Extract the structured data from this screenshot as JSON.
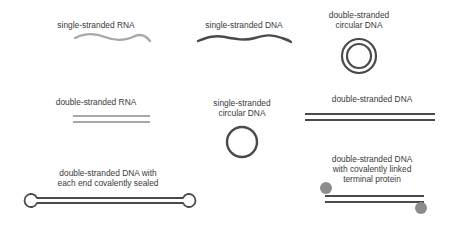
{
  "diagram": {
    "items": [
      {
        "id": "ss-rna",
        "label": "single-stranded RNA",
        "color": "#a8a8a8"
      },
      {
        "id": "ss-dna",
        "label": "single-stranded DNA",
        "color": "#4a4a4a"
      },
      {
        "id": "ds-circ-dna",
        "label": "double-stranded circular DNA",
        "label_lines": [
          "double-stranded",
          "circular DNA"
        ],
        "color": "#4a4a4a"
      },
      {
        "id": "ds-rna",
        "label": "double-stranded RNA",
        "color": "#a8a8a8"
      },
      {
        "id": "ss-circ-dna",
        "label": "single-stranded circular DNA",
        "label_lines": [
          "single-stranded",
          "circular DNA"
        ],
        "color": "#4a4a4a"
      },
      {
        "id": "ds-dna",
        "label": "double-stranded DNA",
        "color": "#4a4a4a"
      },
      {
        "id": "ds-dna-sealed",
        "label": "double-stranded DNA with each end covalently sealed",
        "label_lines": [
          "double-stranded DNA with",
          "each end covalently sealed"
        ],
        "color": "#4a4a4a"
      },
      {
        "id": "ds-dna-protein",
        "label": "double-stranded DNA with covalently linked terminal protein",
        "label_lines": [
          "double-stranded DNA",
          "with covalently linked",
          "terminal protein"
        ],
        "color": "#4a4a4a",
        "protein_color": "#8c8c8c"
      }
    ]
  }
}
